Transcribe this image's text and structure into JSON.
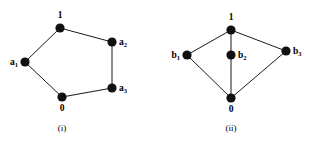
{
  "figure": {
    "width": 325,
    "height": 147,
    "background": "#ffffff",
    "ink_color": "#101010",
    "edge_color": "#1a1a1a"
  },
  "panels": [
    {
      "id": "panel-i",
      "caption": "(i)",
      "caption_x": 62,
      "caption_y": 131,
      "vertices": [
        {
          "id": "top",
          "label": "1",
          "sub": "",
          "x": 60,
          "y": 28,
          "r": 4.6,
          "label_x": 60,
          "label_y": 18,
          "label_anchor": "middle"
        },
        {
          "id": "a2",
          "label": "a",
          "sub": "2",
          "x": 112,
          "y": 42,
          "r": 4.6,
          "label_x": 119,
          "label_y": 45,
          "label_anchor": "start"
        },
        {
          "id": "a3",
          "label": "a",
          "sub": "3",
          "x": 112,
          "y": 88,
          "r": 4.6,
          "label_x": 119,
          "label_y": 91,
          "label_anchor": "start"
        },
        {
          "id": "bot",
          "label": "0",
          "sub": "",
          "x": 62,
          "y": 97,
          "r": 4.6,
          "label_x": 62,
          "label_y": 111,
          "label_anchor": "middle"
        },
        {
          "id": "a1",
          "label": "a",
          "sub": "1",
          "x": 25,
          "y": 62,
          "r": 4.6,
          "label_x": 18,
          "label_y": 65,
          "label_anchor": "end"
        }
      ],
      "edges": [
        {
          "from": "top",
          "to": "a2"
        },
        {
          "from": "a2",
          "to": "a3"
        },
        {
          "from": "a3",
          "to": "bot"
        },
        {
          "from": "bot",
          "to": "a1"
        },
        {
          "from": "a1",
          "to": "top"
        }
      ]
    },
    {
      "id": "panel-ii",
      "caption": "(ii)",
      "caption_x": 231,
      "caption_y": 131,
      "vertices": [
        {
          "id": "top",
          "label": "1",
          "sub": "",
          "x": 231,
          "y": 30,
          "r": 4.6,
          "label_x": 231,
          "label_y": 20,
          "label_anchor": "middle"
        },
        {
          "id": "b1",
          "label": "b",
          "sub": "1",
          "x": 187,
          "y": 55,
          "r": 4.6,
          "label_x": 180,
          "label_y": 58,
          "label_anchor": "end"
        },
        {
          "id": "b2",
          "label": "b",
          "sub": "2",
          "x": 231,
          "y": 55,
          "r": 4.6,
          "label_x": 238,
          "label_y": 58,
          "label_anchor": "start"
        },
        {
          "id": "b3",
          "label": "b",
          "sub": "3",
          "x": 286,
          "y": 51,
          "r": 4.6,
          "label_x": 293,
          "label_y": 54,
          "label_anchor": "start"
        },
        {
          "id": "bot",
          "label": "0",
          "sub": "",
          "x": 231,
          "y": 98,
          "r": 4.6,
          "label_x": 231,
          "label_y": 112,
          "label_anchor": "middle"
        }
      ],
      "edges": [
        {
          "from": "top",
          "to": "b1"
        },
        {
          "from": "top",
          "to": "b2"
        },
        {
          "from": "top",
          "to": "b3"
        },
        {
          "from": "b1",
          "to": "bot"
        },
        {
          "from": "b2",
          "to": "bot"
        },
        {
          "from": "b3",
          "to": "bot"
        }
      ]
    }
  ]
}
